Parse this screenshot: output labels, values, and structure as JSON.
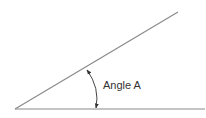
{
  "diagram": {
    "type": "angle",
    "label": "Angle A",
    "colors": {
      "line": "#8a8a8a",
      "arc": "#444444",
      "text": "#333333",
      "background": "#ffffff"
    },
    "vertex": [
      15,
      109
    ],
    "ray_baseline_end": [
      205,
      109
    ],
    "ray_upper_end": [
      178,
      12
    ]
  }
}
